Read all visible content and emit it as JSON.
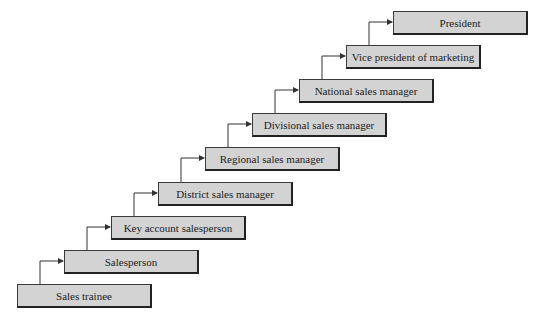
{
  "diagram": {
    "type": "career-ladder",
    "steps": [
      {
        "label": "Sales trainee"
      },
      {
        "label": "Salesperson"
      },
      {
        "label": "Key account salesperson"
      },
      {
        "label": "District sales manager"
      },
      {
        "label": "Regional sales manager"
      },
      {
        "label": "Divisional sales manager"
      },
      {
        "label": "National sales manager"
      },
      {
        "label": "Vice president of marketing"
      },
      {
        "label": "President"
      }
    ],
    "colors": {
      "box_fill": "#d3d3d3",
      "border": "#222222",
      "line": "#333333"
    }
  }
}
